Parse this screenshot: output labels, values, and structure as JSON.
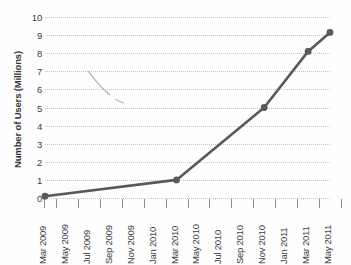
{
  "chart_data": {
    "type": "line",
    "title": "",
    "xlabel": "",
    "ylabel": "Number of Users (Millions)",
    "categories": [
      "Mar 2009",
      "May 2009",
      "Jul 2009",
      "Sep 2009",
      "Nov 2009",
      "Jan 2010",
      "Mar 2010",
      "May 2010",
      "Jul 2010",
      "Sep 2010",
      "Nov 2010",
      "Jan 2011",
      "Mar 2011",
      "May 2011"
    ],
    "series": [
      {
        "name": "Number of Users",
        "points": [
          {
            "x": "Mar 2009",
            "y": 0.1
          },
          {
            "x": "Mar 2010",
            "y": 1.0
          },
          {
            "x": "Nov 2010",
            "y": 5.0
          },
          {
            "x": "Mar 2011",
            "y": 8.1
          },
          {
            "x": "May 2011",
            "y": 9.15
          }
        ],
        "color": "#595959"
      }
    ],
    "ylim": [
      0,
      10
    ],
    "yticks": [
      0,
      1,
      2,
      3,
      4,
      5,
      6,
      7,
      8,
      9,
      10
    ],
    "ytick_labels": [
      "0",
      "1",
      "2",
      "3",
      "4",
      "5",
      "6",
      "7",
      "8",
      "9",
      "10"
    ],
    "grid": true,
    "grid_axis": "y",
    "grid_style": "dotted",
    "grid_color": "#c2c2c4",
    "legend": false,
    "marker": "circle",
    "line_color": "#595959",
    "scan_artifact": true
  },
  "axis": {
    "y_title": "Number of Users (Millions)"
  },
  "title_remnant": "cropped-title-descenders"
}
